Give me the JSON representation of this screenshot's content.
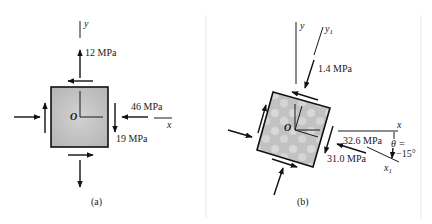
{
  "figure": {
    "panel_a": {
      "caption": "(a)",
      "origin_label": "O",
      "x_axis_label": "x",
      "y_axis_label": "y",
      "stresses": {
        "sigma_y": "12 MPa",
        "sigma_x": "46 MPa",
        "tau_xy": "19 MPa"
      }
    },
    "panel_b": {
      "caption": "(b)",
      "origin_label": "O",
      "x_axis_label": "x",
      "y_axis_label": "y",
      "x1_axis_label": "x",
      "x1_sub": "1",
      "y1_axis_label": "y",
      "y1_sub": "1",
      "angle_label_line1": "θ =",
      "angle_label_line2": "−15°",
      "stresses": {
        "sigma_y1": "1.4 MPa",
        "sigma_x1": "32.6 MPa",
        "tau_x1y1": "31.0 MPa"
      }
    },
    "colors": {
      "element_fill": "#bdbdbd",
      "ink": "#1a1a1a",
      "divider": "#e8e8e8"
    }
  }
}
